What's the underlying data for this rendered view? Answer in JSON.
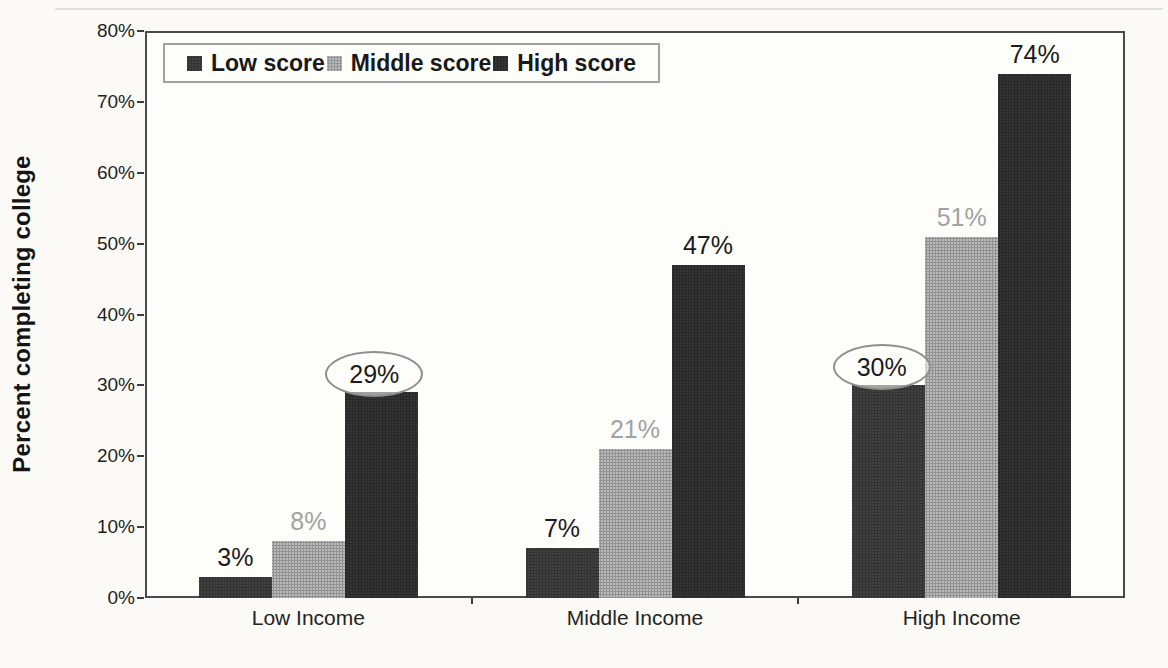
{
  "chart_data": {
    "type": "bar",
    "title": "",
    "xlabel": "",
    "ylabel": "Percent completing college",
    "categories": [
      "Low Income",
      "Middle Income",
      "High Income"
    ],
    "series": [
      {
        "name": "Low score",
        "color": "#414141",
        "label_color": "#1b1b1b",
        "values": [
          3,
          7,
          30
        ],
        "labels": [
          "3%",
          "7%",
          "30%"
        ]
      },
      {
        "name": "Middle score",
        "color": "#bababa",
        "label_color": "#a2a2a2",
        "values": [
          8,
          21,
          51
        ],
        "labels": [
          "8%",
          "21%",
          "51%"
        ]
      },
      {
        "name": "High score",
        "color": "#353535",
        "label_color": "#1b1b1b",
        "values": [
          29,
          47,
          74
        ],
        "labels": [
          "29%",
          "47%",
          "74%"
        ]
      }
    ],
    "ylim": [
      0,
      80
    ],
    "ytick_labels": [
      "0%",
      "10%",
      "20%",
      "30%",
      "40%",
      "50%",
      "60%",
      "70%",
      "80%"
    ],
    "grid": false,
    "legend_position": "top-left",
    "annotations": [
      {
        "type": "circle",
        "series": "High score",
        "category": "Low Income",
        "label": "29%"
      },
      {
        "type": "circle",
        "series": "Low score",
        "category": "High Income",
        "label": "30%"
      }
    ]
  },
  "colors": {
    "paper": "#fbfaf6",
    "plot_border": "#4a4a4a",
    "legend_border": "#a2a2a2",
    "circle_stroke": "#8f8f8f",
    "axis_text": "#1f1f1f"
  }
}
